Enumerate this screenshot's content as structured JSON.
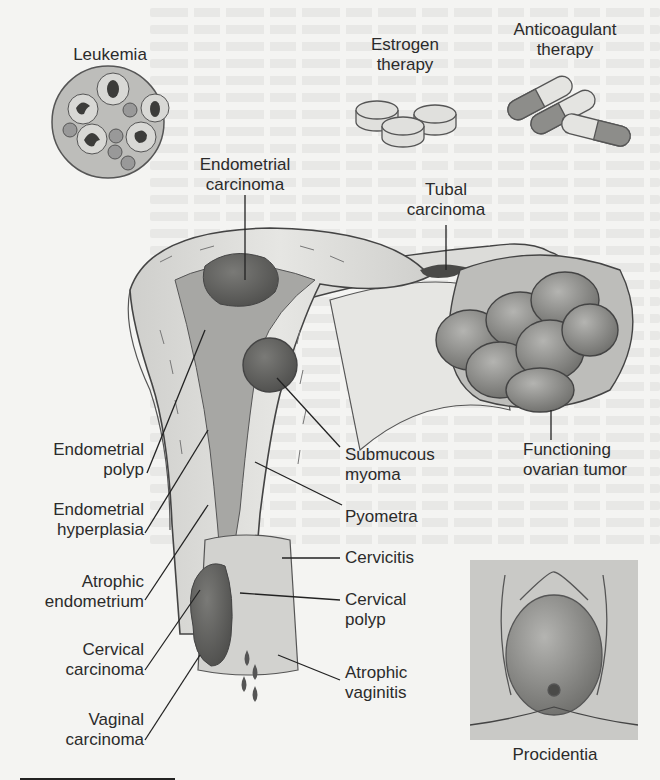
{
  "figure": {
    "type": "anatomical-illustration",
    "palette": {
      "background": "#f4f4f2",
      "ink": "#2b2b2b",
      "tissue_light": "#d9d9d6",
      "tissue_mid": "#9a9a97",
      "tissue_dark": "#5e5e5c",
      "inset_bg": "#c9c9c6"
    }
  },
  "labels": {
    "leukemia": {
      "lines": [
        "Leukemia"
      ]
    },
    "estrogen_therapy": {
      "lines": [
        "Estrogen",
        "therapy"
      ]
    },
    "anticoagulant_therapy": {
      "lines": [
        "Anticoagulant",
        "therapy"
      ]
    },
    "endometrial_carcinoma": {
      "lines": [
        "Endometrial",
        "carcinoma"
      ]
    },
    "tubal_carcinoma": {
      "lines": [
        "Tubal",
        "carcinoma"
      ]
    },
    "endometrial_polyp": {
      "lines": [
        "Endometrial",
        "polyp"
      ]
    },
    "submucous_myoma": {
      "lines": [
        "Submucous",
        "myoma"
      ]
    },
    "functioning_ovarian_tumor": {
      "lines": [
        "Functioning",
        "ovarian tumor"
      ]
    },
    "endometrial_hyperplasia": {
      "lines": [
        "Endometrial",
        "hyperplasia"
      ]
    },
    "pyometra": {
      "lines": [
        "Pyometra"
      ]
    },
    "cervicitis": {
      "lines": [
        "Cervicitis"
      ]
    },
    "atrophic_endometrium": {
      "lines": [
        "Atrophic",
        "endometrium"
      ]
    },
    "cervical_polyp": {
      "lines": [
        "Cervical",
        "polyp"
      ]
    },
    "cervical_carcinoma": {
      "lines": [
        "Cervical",
        "carcinoma"
      ]
    },
    "atrophic_vaginitis": {
      "lines": [
        "Atrophic",
        "vaginitis"
      ]
    },
    "vaginal_carcinoma": {
      "lines": [
        "Vaginal",
        "carcinoma"
      ]
    },
    "procidentia": {
      "lines": [
        "Procidentia"
      ]
    }
  },
  "icons": {
    "leukemia_cells": "blood-smear-circle",
    "estrogen_pills": "tablet-pills",
    "anticoagulant_capsules": "capsules",
    "ovarian_tumor": "lobulated-mass",
    "procidentia_inset": "prolapse-inset"
  }
}
